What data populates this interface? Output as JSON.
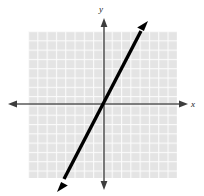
{
  "figure": {
    "name": "coordinate-plane-line-graph",
    "background_color": "#ffffff",
    "grid": {
      "fill_color": "#e4e4e4",
      "line_color": "#fafafa",
      "cell_size": 9.3,
      "left": 28,
      "top": 31,
      "right": 177,
      "bottom": 178,
      "columns": 16,
      "rows": 16,
      "visible": true
    },
    "axes": {
      "color": "#5a5a5a",
      "stroke_width": 1.6,
      "origin": {
        "x": 104,
        "y": 104
      },
      "x_axis": {
        "label": "x",
        "from_x": 8,
        "to_x": 188,
        "y": 104,
        "arrows": "both"
      },
      "y_axis": {
        "label": "y",
        "x": 104,
        "from_y": 18,
        "to_y": 190,
        "arrows": "both"
      },
      "x_label_pos": {
        "x": 193,
        "y": 107
      },
      "y_label_pos": {
        "x": 101,
        "y": 11
      },
      "tick_labels": []
    },
    "line": {
      "color": "#000000",
      "stroke_width": 3.4,
      "arrows": "both",
      "start": {
        "x": 57,
        "y": 192
      },
      "end": {
        "x": 148,
        "y": 21
      },
      "passes_through_origin": true,
      "slope": 1.88,
      "intercept": 0,
      "equation": "y = 2x"
    }
  }
}
